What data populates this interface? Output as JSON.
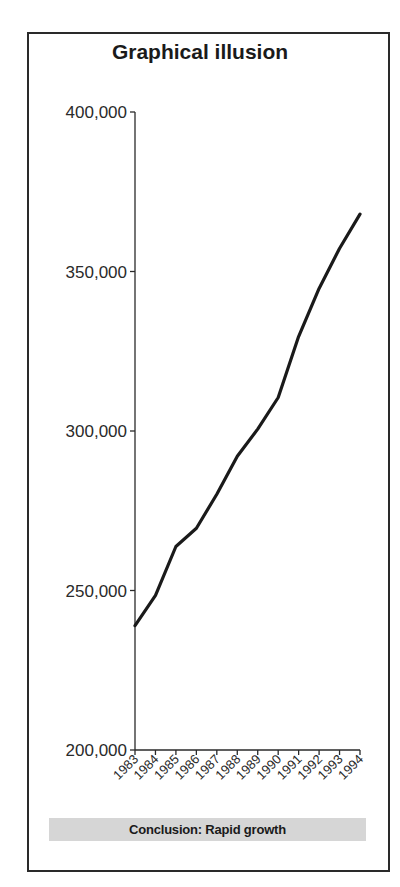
{
  "chart_data": {
    "type": "line",
    "title": "Graphical illusion",
    "xlabel": "",
    "ylabel": "",
    "categories": [
      "1983",
      "1984",
      "1985",
      "1986",
      "1987",
      "1988",
      "1989",
      "1990",
      "1991",
      "1992",
      "1993",
      "1994"
    ],
    "values": [
      239000,
      248500,
      263800,
      269500,
      280200,
      292100,
      300600,
      310500,
      329600,
      344700,
      357200,
      368000
    ],
    "ylim": [
      200000,
      400000
    ],
    "yticks": [
      200000,
      250000,
      300000,
      350000,
      400000
    ],
    "ytick_labels": [
      "200,000",
      "250,000",
      "300,000",
      "350,000",
      "400,000"
    ],
    "grid": false,
    "legend": null,
    "annotation": "Conclusion: Rapid growth",
    "line_color": "#1a1a1a"
  },
  "title": "Graphical illusion",
  "conclusion": "Conclusion: Rapid growth"
}
